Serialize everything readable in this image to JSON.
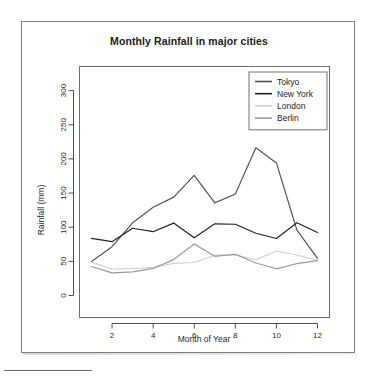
{
  "figure": {
    "title": "Monthly Rainfall in major cities",
    "background": "#ffffff",
    "frame_color": "#7d7d7d"
  },
  "chart_data": {
    "type": "line",
    "title": "Monthly Rainfall in major cities",
    "xlabel": "Month of Year",
    "ylabel": "Rainfall (mm)",
    "x": [
      1,
      2,
      3,
      4,
      5,
      6,
      7,
      8,
      9,
      10,
      11,
      12
    ],
    "xlim": [
      1,
      12
    ],
    "ylim": [
      0,
      306
    ],
    "xticks": [
      2,
      4,
      6,
      8,
      10,
      12
    ],
    "yticks": [
      0,
      50,
      100,
      150,
      200,
      250,
      300
    ],
    "xtick_labels": [
      "2",
      "4",
      "6",
      "8",
      "10",
      "12"
    ],
    "ytick_labels": [
      "0",
      "50",
      "100",
      "150",
      "200",
      "250",
      "300"
    ],
    "grid": false,
    "legend_position": "top-right",
    "series": [
      {
        "name": "Tokyo",
        "color": "#555555",
        "values": [
          49.9,
          71.5,
          106.4,
          129.2,
          144.0,
          176.0,
          135.6,
          148.5,
          216.4,
          194.1,
          95.6,
          54.4
        ]
      },
      {
        "name": "New York",
        "color": "#222222",
        "values": [
          83.6,
          78.8,
          98.5,
          93.4,
          106.0,
          84.5,
          105.0,
          104.3,
          91.2,
          83.5,
          106.6,
          92.3
        ]
      },
      {
        "name": "London",
        "color": "#cfcfcf",
        "values": [
          48.9,
          38.8,
          39.3,
          41.4,
          47.0,
          48.3,
          59.0,
          59.6,
          52.4,
          65.2,
          59.3,
          51.2
        ]
      },
      {
        "name": "Berlin",
        "color": "#9a9a9a",
        "values": [
          42.4,
          33.2,
          34.5,
          39.7,
          52.6,
          75.5,
          57.4,
          60.4,
          47.6,
          39.1,
          46.8,
          51.1
        ]
      }
    ]
  },
  "legend": {
    "items": [
      {
        "label": "Tokyo",
        "color": "#555555"
      },
      {
        "label": "New York",
        "color": "#222222"
      },
      {
        "label": "London",
        "color": "#cfcfcf"
      },
      {
        "label": "Berlin",
        "color": "#9a9a9a"
      }
    ]
  }
}
